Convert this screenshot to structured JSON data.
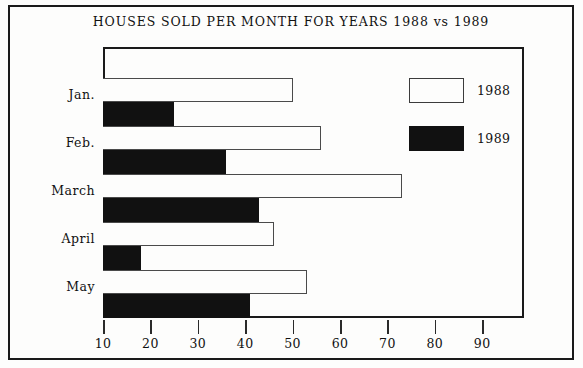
{
  "chart_data": {
    "type": "bar",
    "orientation": "horizontal",
    "title": "HOUSES SOLD PER MONTH FOR YEARS 1988 vs 1989",
    "xlabel": "",
    "ylabel": "",
    "categories": [
      "Jan.",
      "Feb.",
      "March",
      "April",
      "May"
    ],
    "series": [
      {
        "name": "1988",
        "values": [
          50,
          56,
          73,
          46,
          53
        ],
        "color": "#fdfdfc",
        "edge_color": "#4a4a4a"
      },
      {
        "name": "1989",
        "values": [
          25,
          36,
          43,
          18,
          41
        ],
        "color": "#111111",
        "edge_color": "#111111"
      }
    ],
    "xlim": [
      10,
      97
    ],
    "x_ticks": [
      10,
      20,
      30,
      40,
      50,
      60,
      70,
      80,
      90
    ],
    "x_tick_labels": [
      "10",
      "20",
      "30",
      "40",
      "50",
      "60",
      "70",
      "80",
      "90"
    ],
    "grid": false,
    "legend_position": "top-right",
    "legend_entries": [
      "1988",
      "1989"
    ]
  },
  "legend": {
    "rows": [
      {
        "label": "1988",
        "swatch": "legend-swatch-1988"
      },
      {
        "label": "1989",
        "swatch": "legend-swatch-1989"
      }
    ]
  }
}
